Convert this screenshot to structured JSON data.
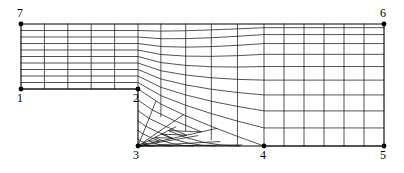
{
  "figure": {
    "type": "mesh-diagram",
    "width": 404,
    "height": 173,
    "background_color": "#ffffff",
    "line_color": "#1a1a1a",
    "node_color": "#000000"
  },
  "vertices": [
    {
      "id": "1",
      "label": "1",
      "x": 21,
      "y": 89,
      "label_x": 17,
      "label_y": 92,
      "marker": true
    },
    {
      "id": "2",
      "label": "2",
      "x": 138,
      "y": 89,
      "label_x": 133,
      "label_y": 92,
      "marker": true
    },
    {
      "id": "3",
      "label": "3",
      "x": 138,
      "y": 146,
      "label_x": 133,
      "label_y": 149,
      "marker": true
    },
    {
      "id": "4",
      "label": "4",
      "x": 264,
      "y": 146,
      "label_x": 260,
      "label_y": 149,
      "marker": true
    },
    {
      "id": "5",
      "label": "5",
      "x": 384,
      "y": 146,
      "label_x": 380,
      "label_y": 149,
      "marker": true
    },
    {
      "id": "6",
      "label": "6",
      "x": 384,
      "y": 24,
      "label_x": 380,
      "label_y": 7,
      "marker": true
    },
    {
      "id": "7",
      "label": "7",
      "x": 21,
      "y": 24,
      "label_x": 17,
      "label_y": 7,
      "marker": true
    }
  ],
  "chart_data": {
    "type": "mesh",
    "domain_outline": [
      [
        21,
        24
      ],
      [
        384,
        24
      ],
      [
        384,
        146
      ],
      [
        138,
        146
      ],
      [
        138,
        89
      ],
      [
        21,
        89
      ]
    ],
    "blocks": [
      {
        "name": "inlet-channel",
        "corners": [
          "7",
          "1",
          "2",
          "top-of-2"
        ],
        "x_divisions": 5,
        "y_divisions": 10
      },
      {
        "name": "transition",
        "x_divisions": 5,
        "y_divisions": 11
      },
      {
        "name": "step-fan",
        "origin": "3",
        "rays": 8,
        "arcs": 5
      },
      {
        "name": "downstream-channel",
        "corners": [
          "4",
          "5",
          "6",
          "top"
        ],
        "x_divisions": 6,
        "y_divisions": 11
      }
    ],
    "counts": {
      "horizontal_lines_inlet": 11,
      "horizontal_lines_outlet": 12,
      "vertical_lines_inlet": 6,
      "vertical_lines_outlet": 7,
      "fan_rays_from_node_3": 8
    },
    "legend": [],
    "xlabel": "",
    "ylabel": ""
  }
}
